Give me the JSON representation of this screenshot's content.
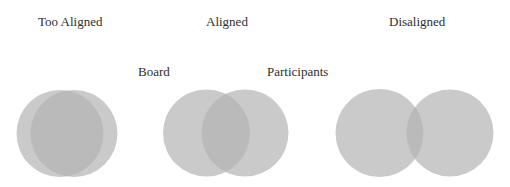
{
  "titles": {
    "too_aligned": "Too Aligned",
    "aligned": "Aligned",
    "disaligned": "Disaligned"
  },
  "legend": {
    "board": "Board",
    "participants": "Participants"
  },
  "colors": {
    "circle_fill": "#b3b3b3",
    "circle_opacity": "0.7"
  }
}
